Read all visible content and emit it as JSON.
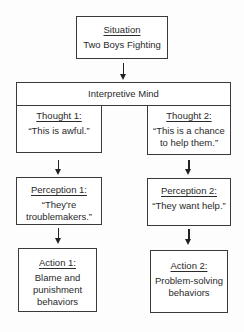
{
  "situation": {
    "title": "Situation",
    "body": "Two Boys Fighting"
  },
  "interpretive_mind": {
    "title": "Interpretive Mind"
  },
  "thought1": {
    "title": "Thought 1:",
    "body": "“This is awful.”"
  },
  "thought2": {
    "title": "Thought 2:",
    "body_line1": "“This is a chance",
    "body_line2": "to help them.”"
  },
  "perception1": {
    "title": "Perception 1:",
    "body_line1": "“They're",
    "body_line2": "troublemakers.”"
  },
  "perception2": {
    "title": "Perception 2:",
    "body": "“They want help.”"
  },
  "action1": {
    "title": "Action 1:",
    "body_line1": "Blame and",
    "body_line2": "punishment",
    "body_line3": "behaviors"
  },
  "action2": {
    "title": "Action 2:",
    "body_line1": "Problem-solving",
    "body_line2": "behaviors"
  }
}
